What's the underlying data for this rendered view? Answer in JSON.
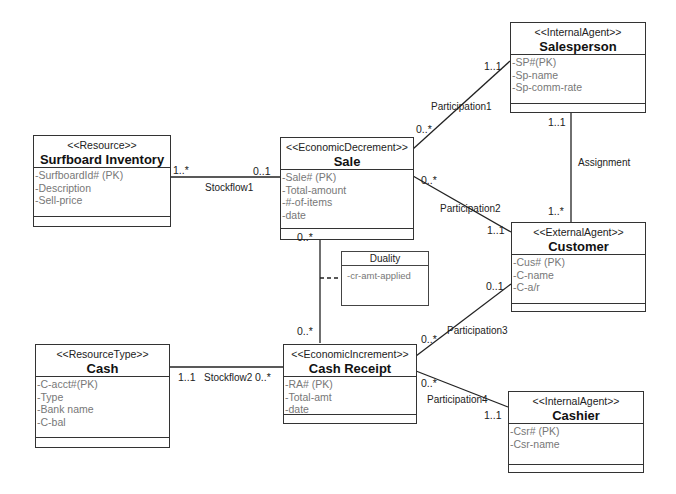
{
  "classes": {
    "salesperson": {
      "stereotype": "<<InternalAgent>>",
      "name": "Salesperson",
      "attributes": [
        "-SP#(PK)",
        "-Sp-name",
        "-Sp-comm-rate"
      ]
    },
    "surfboard": {
      "stereotype": "<<Resource>>",
      "name": "Surfboard Inventory",
      "attributes": [
        "-SurfboardId# (PK)",
        "-Description",
        "-Sell-price"
      ]
    },
    "sale": {
      "stereotype": "<<EconomicDecrement>>",
      "name": "Sale",
      "attributes": [
        "-Sale# (PK)",
        "-Total-amount",
        "-#-of-items",
        "-date"
      ]
    },
    "customer": {
      "stereotype": "<<ExternalAgent>>",
      "name": "Customer",
      "attributes": [
        "-Cus# (PK)",
        "-C-name",
        "-C-a/r"
      ]
    },
    "cash": {
      "stereotype": "<<ResourceType>>",
      "name": "Cash",
      "attributes": [
        "-C-acct#(PK)",
        "-Type",
        "-Bank name",
        "-C-bal"
      ]
    },
    "cashreceipt": {
      "stereotype": "<<EconomicIncrement>>",
      "name": "Cash Receipt",
      "attributes": [
        "-RA# (PK)",
        "-Total-amt",
        "-date"
      ]
    },
    "cashier": {
      "stereotype": "<<InternalAgent>>",
      "name": "Cashier",
      "attributes": [
        "-Csr# (PK)",
        "-Csr-name"
      ]
    }
  },
  "association_class": {
    "name": "Duality",
    "attribute": "-cr-amt-applied"
  },
  "associations": {
    "stockflow1": {
      "label": "Stockflow1",
      "from_mult": "1..*",
      "to_mult": "0..1"
    },
    "participation1": {
      "label": "Participation1",
      "from_mult": "0..*",
      "to_mult": "1..1"
    },
    "assignment": {
      "label": "Assignment",
      "from_mult": "1..1",
      "to_mult": "1..*"
    },
    "participation2": {
      "label": "Participation2",
      "from_mult": "0..*",
      "to_mult": "1..1"
    },
    "duality": {
      "from_mult": "0..*",
      "to_mult": "0..*"
    },
    "participation3": {
      "label": "Participation3",
      "from_mult": "0..*",
      "to_mult": "0..1"
    },
    "stockflow2": {
      "label": "Stockflow2",
      "from_mult": "1..1",
      "to_mult": "0..*"
    },
    "participation4": {
      "label": "Participation4",
      "from_mult": "0..*",
      "to_mult": "1..1"
    }
  }
}
